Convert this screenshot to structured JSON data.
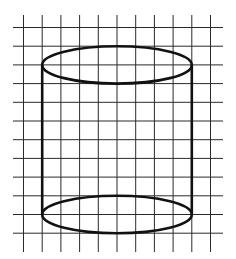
{
  "figure": {
    "grid": {
      "columns": 11,
      "rows": 12,
      "line_color": "#2a2a2a"
    },
    "shape": {
      "type": "cylinder",
      "stroke_color": "#111111",
      "width_cells": 8,
      "height_cells": 8,
      "ellipse_height_cells": 2
    }
  }
}
